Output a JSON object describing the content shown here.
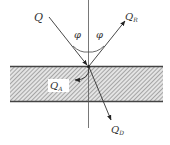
{
  "diagram": {
    "type": "ray-reflection-absorption-transmission",
    "labels": {
      "incident": "Q",
      "reflected": "Q",
      "reflected_sub": "R",
      "absorbed": "Q",
      "absorbed_sub": "A",
      "transmitted": "Q",
      "transmitted_sub": "D",
      "angle_left": "φ",
      "angle_right": "φ"
    },
    "colors": {
      "line": "#333333",
      "slab_fill": "#d8d8d8",
      "slab_hatch": "#777777",
      "slab_border": "#444444"
    }
  }
}
